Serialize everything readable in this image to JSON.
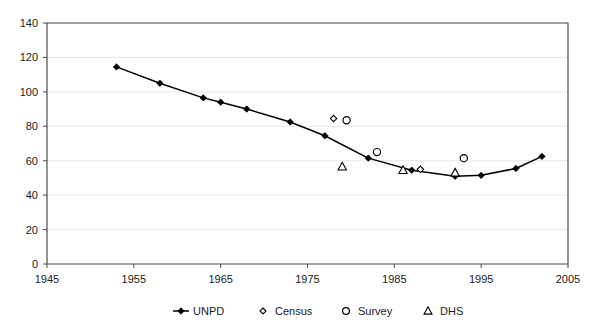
{
  "chart_data": {
    "type": "line",
    "title": "",
    "xlabel": "",
    "ylabel": "",
    "xlim": [
      1945,
      2005
    ],
    "ylim": [
      0,
      140
    ],
    "xticks": [
      1945,
      1955,
      1965,
      1975,
      1985,
      1995,
      2005
    ],
    "yticks": [
      0,
      20,
      40,
      60,
      80,
      100,
      120,
      140
    ],
    "grid": "horizontal",
    "legend_position": "bottom",
    "series": [
      {
        "name": "UNPD",
        "marker": "filled-diamond",
        "line": true,
        "x": [
          1953,
          1958,
          1963,
          1965,
          1968,
          1973,
          1977,
          1982,
          1987,
          1992,
          1995,
          1999,
          2002
        ],
        "values": [
          114.5,
          105,
          96.5,
          94,
          90,
          82.5,
          74.5,
          61.5,
          54.5,
          51,
          51.5,
          55.5,
          62.5
        ]
      },
      {
        "name": "Census",
        "marker": "open-diamond",
        "line": false,
        "x": [
          1978,
          1988
        ],
        "values": [
          84.5,
          55
        ]
      },
      {
        "name": "Survey",
        "marker": "open-circle",
        "line": false,
        "x": [
          1979.5,
          1983,
          1993
        ],
        "values": [
          83.5,
          65,
          61.5
        ]
      },
      {
        "name": "DHS",
        "marker": "open-triangle",
        "line": false,
        "x": [
          1979,
          1986,
          1992
        ],
        "values": [
          56.5,
          54.5,
          53
        ]
      }
    ]
  },
  "axis": {
    "y_labels": [
      "140",
      "120",
      "100",
      "80",
      "60",
      "40",
      "20",
      "0"
    ],
    "x_labels": [
      "1945",
      "1955",
      "1965",
      "1975",
      "1985",
      "1995",
      "2005"
    ]
  },
  "legend": {
    "items": [
      {
        "label": "UNPD",
        "marker": "line-filled-diamond"
      },
      {
        "label": "Census",
        "marker": "open-diamond"
      },
      {
        "label": "Survey",
        "marker": "open-circle"
      },
      {
        "label": "DHS",
        "marker": "open-triangle"
      }
    ]
  },
  "colors": {
    "line": "#000000",
    "axis": "#4d4d4d",
    "grid": "#e8e8e8",
    "text": "#1a1a1a",
    "background": "#ffffff"
  }
}
